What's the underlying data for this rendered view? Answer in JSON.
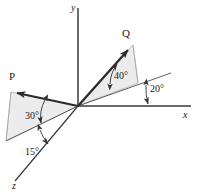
{
  "figure": {
    "type": "3d-vector-diagram",
    "background_color": "#ffffff",
    "line_color": "#3a3a3a",
    "vector_color": "#2b2b2b",
    "plane_fill_color": "#ebebeb",
    "plane_stroke_color": "#9a9a9a",
    "axes": {
      "x": {
        "label": "x",
        "label_x": 183,
        "label_y": 118
      },
      "y": {
        "label": "y",
        "label_x": 71,
        "label_y": 11
      },
      "z": {
        "label": "z",
        "label_x": 12,
        "label_y": 189
      }
    },
    "vectors": [
      {
        "name": "P",
        "label": "P",
        "label_x": 9,
        "label_y": 80,
        "tip_x": 11,
        "tip_y": 92
      },
      {
        "name": "Q",
        "label": "Q",
        "label_x": 122,
        "label_y": 37,
        "tip_x": 133,
        "tip_y": 45
      }
    ],
    "angles": [
      {
        "name": "angle-P-elevation",
        "label": "30°",
        "value": 30,
        "unit": "degrees",
        "label_x": 25,
        "label_y": 119,
        "between": "P and its projection in the xz-plane",
        "arrow_style": "double"
      },
      {
        "name": "angle-P-azimuth",
        "label": "15°",
        "value": 15,
        "unit": "degrees",
        "label_x": 25,
        "label_y": 155,
        "between": "projection of P and the z-axis",
        "arrow_style": "double"
      },
      {
        "name": "angle-Q-elevation",
        "label": "40°",
        "value": 40,
        "unit": "degrees",
        "label_x": 114,
        "label_y": 79,
        "between": "Q and its projection in the xz-plane",
        "arrow_style": "double"
      },
      {
        "name": "angle-Q-azimuth",
        "label": "20°",
        "value": 20,
        "unit": "degrees",
        "label_x": 150,
        "label_y": 92,
        "between": "projection of Q and the x-axis",
        "arrow_style": "single"
      }
    ]
  }
}
